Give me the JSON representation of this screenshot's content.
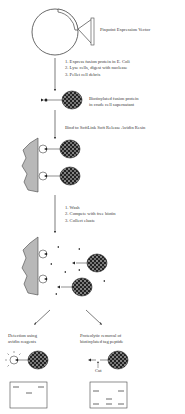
{
  "title": "Pinpoint Expression Vector",
  "step1": {
    "lines": [
      "1. Express fusion protein in E. Coli",
      "2. Lyse cells, digest with nuclease",
      "3. Pellet cell debris"
    ]
  },
  "product1": {
    "lines": [
      "Biotinylated fusion protein",
      "in crude cell supernatant"
    ]
  },
  "step2": {
    "text": "Bind to SoftLink Soft Release Avidin Resin"
  },
  "step3": {
    "lines": [
      "1. Wash",
      "2. Compete with free biotin",
      "3. Collect eluate"
    ]
  },
  "branch_left": {
    "lines": [
      "Detection using",
      "avidin reagents"
    ]
  },
  "branch_right": {
    "lines": [
      "Proteolytic removal of",
      "biotinylated tag peptide"
    ]
  },
  "cut_label": "Cut",
  "colors": {
    "line": "#444444",
    "resin": "#b8b8b8",
    "protein": "#222222"
  }
}
